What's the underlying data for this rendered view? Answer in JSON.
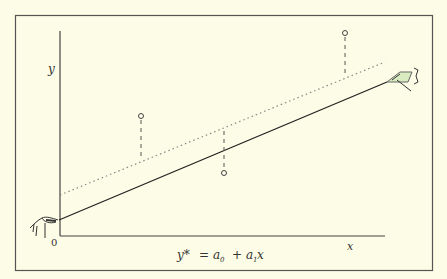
{
  "diagram": {
    "type": "regression-line-illustration",
    "axis_labels": {
      "y": "y",
      "x": "x",
      "origin": "0"
    },
    "equation": {
      "lhs": "y*",
      "eq": "=",
      "a0": "a",
      "a0_sub": "0",
      "plus": "+",
      "a1": "a",
      "a1_sub": "1",
      "var": "x"
    },
    "colors": {
      "background": "#fdfce6",
      "ink": "#333333",
      "dotted": "#888888",
      "accent": "#9ccc7a"
    },
    "points": [
      {
        "x": 141,
        "y": 116
      },
      {
        "x": 224,
        "y": 173
      },
      {
        "x": 345,
        "y": 33
      }
    ]
  }
}
